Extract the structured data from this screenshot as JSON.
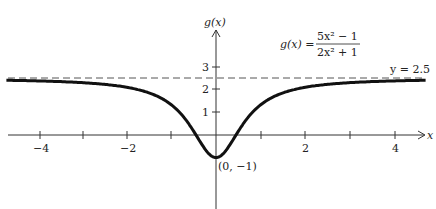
{
  "chart_data": {
    "type": "line",
    "title": "",
    "function_label": "g(x) = (5x^2 - 1)/(2x^2 + 1)",
    "formula": {
      "lhs": "g(x) =",
      "numerator": "5x² − 1",
      "denominator": "2x² + 1"
    },
    "xlabel": "x",
    "ylabel": "g(x)",
    "xlim": [
      -4.7,
      4.7
    ],
    "ylim": [
      -1.6,
      5
    ],
    "x_ticks": [
      -4,
      -3,
      -2,
      -1,
      1,
      2,
      3,
      4
    ],
    "x_tick_labels": [
      "−4",
      "−2",
      "2",
      "4"
    ],
    "x_tick_label_values": [
      -4,
      -2,
      2,
      4
    ],
    "y_ticks": [
      1,
      2,
      3
    ],
    "y_tick_labels": [
      "1",
      "2",
      "3"
    ],
    "asymptote": {
      "y": 2.5,
      "label": "y = 2.5",
      "style": "dashed"
    },
    "annotations": [
      {
        "text": "(0, −1)",
        "x": 0,
        "y": -1
      }
    ],
    "grid": false,
    "series": [
      {
        "name": "g(x)",
        "expression": "(5x^2-1)/(2x^2+1)",
        "x_range": [
          -4.7,
          4.7
        ]
      }
    ]
  },
  "labels": {
    "x_axis": "x",
    "y_axis": "g(x)",
    "formula_lhs": "g(x) =",
    "formula_num": "5x² − 1",
    "formula_den": "2x² + 1",
    "asymptote": "y = 2.5",
    "min_point": "(0, −1)",
    "tick_m4": "−4",
    "tick_m2": "−2",
    "tick_2": "2",
    "tick_4": "4",
    "tick_y1": "1",
    "tick_y2": "2",
    "tick_y3": "3"
  }
}
